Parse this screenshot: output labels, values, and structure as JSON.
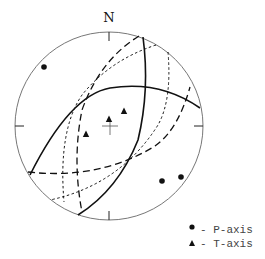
{
  "diagram": {
    "type": "stereonet",
    "north_label": "N",
    "primitive": {
      "cx": 109,
      "cy": 126,
      "r": 94
    },
    "center_mark": {
      "x": 110,
      "y": 126
    },
    "p_axes": [
      {
        "x": 44,
        "y": 67
      },
      {
        "x": 162,
        "y": 181
      },
      {
        "x": 181,
        "y": 177
      }
    ],
    "t_axes": [
      {
        "x": 109,
        "y": 119
      },
      {
        "x": 124,
        "y": 111
      },
      {
        "x": 86,
        "y": 134
      }
    ],
    "great_circles": [
      {
        "style": "solid",
        "d": "M 30 175 Q 70 95 110 88 Q 160 80 200 108"
      },
      {
        "style": "solid",
        "d": "M 143 37 Q 150 90 138 140 Q 118 190 78 215"
      },
      {
        "style": "dashed",
        "d": "M 139 36 Q 100 60 82 110 Q 72 160 82 212"
      },
      {
        "style": "dashed",
        "d": "M 28 172 Q 100 180 155 146 Q 178 130 190 87"
      },
      {
        "style": "dotted",
        "d": "M 156 45 Q 110 60 82 95 Q 58 130 64 202"
      },
      {
        "style": "dotted",
        "d": "M 168 52 Q 172 100 158 125 Q 120 185 50 200"
      }
    ],
    "colors": {
      "line": "#111111",
      "primitive": "#777777"
    }
  },
  "legend": {
    "items": [
      {
        "symbol": "circle",
        "label": "- P-axis"
      },
      {
        "symbol": "triangle",
        "label": "- T-axis"
      }
    ]
  }
}
